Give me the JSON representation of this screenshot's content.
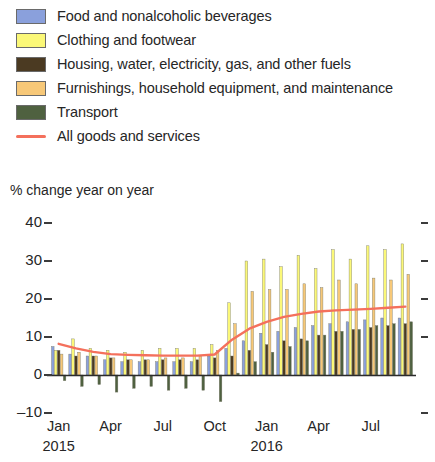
{
  "legend": {
    "items": [
      {
        "label": "Food and nonalcoholic beverages",
        "color": "#8aa0dc",
        "marker": "swatch",
        "icon": "legend-swatch-icon"
      },
      {
        "label": "Clothing and footwear",
        "color": "#fbf878",
        "marker": "swatch",
        "icon": "legend-swatch-icon"
      },
      {
        "label": "Housing, water, electricity, gas, and other fuels",
        "color": "#4b3a22",
        "marker": "swatch",
        "icon": "legend-swatch-icon"
      },
      {
        "label": "Furnishings, household equipment, and maintenance",
        "color": "#f7c878",
        "marker": "swatch",
        "icon": "legend-swatch-icon"
      },
      {
        "label": "Transport",
        "color": "#4f6140",
        "marker": "swatch",
        "icon": "legend-swatch-icon"
      },
      {
        "label": "All goods and services",
        "color": "#f4705c",
        "marker": "line",
        "icon": "legend-line-icon"
      }
    ]
  },
  "axis": {
    "y_title": "% change year on year",
    "y_ticks": [
      "40",
      "30",
      "20",
      "10",
      "0",
      "–10"
    ],
    "x_ticks": [
      "Jan",
      "Apr",
      "Jul",
      "Oct",
      "Jan",
      "Apr",
      "Jul"
    ],
    "x_years": [
      "2015",
      "2016"
    ]
  },
  "chart_data": {
    "type": "bar",
    "title": "",
    "subtitle": "",
    "xlabel": "",
    "ylabel": "% change year on year",
    "ylim": [
      -10,
      40
    ],
    "ytick_values": [
      40,
      30,
      20,
      10,
      0,
      -10
    ],
    "grid": false,
    "legend_position": "top",
    "categories": [
      "Jan 2015",
      "Feb 2015",
      "Mar 2015",
      "Apr 2015",
      "May 2015",
      "Jun 2015",
      "Jul 2015",
      "Aug 2015",
      "Sep 2015",
      "Oct 2015",
      "Nov 2015",
      "Dec 2015",
      "Jan 2016",
      "Feb 2016",
      "Mar 2016",
      "Apr 2016",
      "May 2016",
      "Jun 2016",
      "Jul 2016",
      "Aug 2016",
      "Sep 2016"
    ],
    "xtick_labels": {
      "Jan 2015": "Jan",
      "Apr 2015": "Apr",
      "Jul 2015": "Jul",
      "Oct 2015": "Oct",
      "Jan 2016": "Jan",
      "Apr 2016": "Apr",
      "Jul 2016": "Jul"
    },
    "series": [
      {
        "name": "Food and nonalcoholic beverages",
        "color": "#8aa0dc",
        "type": "bar",
        "values": [
          7.5,
          5.5,
          5.0,
          4.0,
          3.5,
          3.5,
          3.5,
          3.5,
          3.5,
          5.0,
          7.0,
          9.0,
          11.0,
          11.5,
          12.5,
          13.0,
          13.5,
          14.0,
          14.5,
          15.0,
          15.0
        ]
      },
      {
        "name": "Clothing and footwear",
        "color": "#fbf878",
        "type": "bar",
        "values": [
          6.5,
          9.5,
          7.0,
          6.5,
          6.0,
          6.5,
          7.0,
          7.0,
          7.0,
          8.0,
          19.0,
          30.0,
          30.5,
          28.5,
          31.5,
          28.0,
          33.0,
          30.5,
          34.0,
          33.0,
          34.5
        ]
      },
      {
        "name": "Housing, water, electricity, gas, and other fuels",
        "color": "#4b3a22",
        "type": "bar",
        "values": [
          6.5,
          5.0,
          5.0,
          4.5,
          4.0,
          4.0,
          4.0,
          4.0,
          4.0,
          4.5,
          5.0,
          6.5,
          8.0,
          9.0,
          9.5,
          10.5,
          11.5,
          12.0,
          12.5,
          13.0,
          13.5
        ]
      },
      {
        "name": "Furnishings, household equipment, and maintenance",
        "color": "#f7c878",
        "type": "bar",
        "values": [
          5.5,
          6.0,
          5.0,
          4.5,
          4.0,
          4.0,
          4.5,
          4.5,
          5.0,
          6.5,
          13.5,
          22.0,
          22.5,
          22.5,
          24.0,
          23.0,
          25.0,
          24.0,
          25.5,
          25.0,
          26.5
        ]
      },
      {
        "name": "Transport",
        "color": "#4f6140",
        "type": "bar",
        "values": [
          -1.5,
          -3.0,
          -2.5,
          -4.5,
          -3.5,
          -3.0,
          -4.0,
          -3.5,
          -4.0,
          -7.0,
          0.5,
          3.5,
          6.0,
          7.5,
          9.0,
          10.5,
          11.5,
          12.0,
          13.0,
          13.5,
          14.0
        ]
      },
      {
        "name": "All goods and services",
        "color": "#f4705c",
        "type": "line",
        "values": [
          8.2,
          7.0,
          6.1,
          5.5,
          5.3,
          5.2,
          5.1,
          5.1,
          5.1,
          5.4,
          9.3,
          12.2,
          14.0,
          15.3,
          16.1,
          16.7,
          17.0,
          17.2,
          17.4,
          17.7,
          18.0
        ]
      }
    ]
  }
}
